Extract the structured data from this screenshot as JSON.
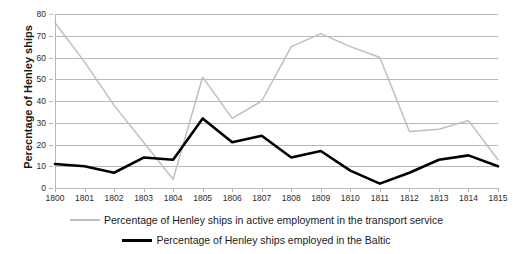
{
  "chart_data": {
    "type": "line",
    "title": "",
    "xlabel": "",
    "ylabel": "Perecntage of Henley ships",
    "x": [
      1800,
      1801,
      1802,
      1803,
      1804,
      1805,
      1806,
      1807,
      1808,
      1809,
      1810,
      1811,
      1812,
      1813,
      1814,
      1815
    ],
    "categories": [
      "1800",
      "1801",
      "1802",
      "1803",
      "1804",
      "1805",
      "1806",
      "1807",
      "1808",
      "1809",
      "1810",
      "1811",
      "1812",
      "1813",
      "1814",
      "1815"
    ],
    "ylim": [
      0,
      80
    ],
    "yticks": [
      0,
      10,
      20,
      30,
      40,
      50,
      60,
      70,
      80
    ],
    "ytick_labels": [
      "0",
      "10",
      "20",
      "30",
      "40",
      "50",
      "60",
      "70",
      "80"
    ],
    "grid": true,
    "legend_position": "bottom",
    "series": [
      {
        "name": "Percentage of Henley ships in active employment in the transport service",
        "color": "#bfbfbf",
        "values": [
          76,
          58,
          38,
          21,
          4,
          51,
          32,
          40,
          65,
          71,
          65,
          60,
          26,
          27,
          31,
          13
        ]
      },
      {
        "name": "Percentage of Henley ships employed in the Baltic",
        "color": "#000000",
        "values": [
          11,
          10,
          7,
          14,
          13,
          32,
          21,
          24,
          14,
          17,
          8,
          2,
          7,
          13,
          15,
          10
        ]
      }
    ]
  },
  "legend": {
    "items": [
      {
        "label": "Percentage of Henley ships in active employment in the transport service",
        "swatch": "gray"
      },
      {
        "label": "Percentage of Henley ships employed in the Baltic",
        "swatch": "black"
      }
    ]
  }
}
